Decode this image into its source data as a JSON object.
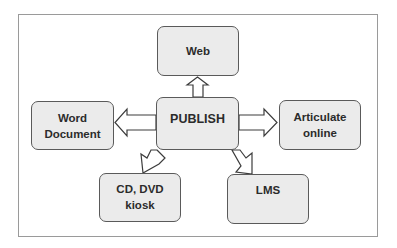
{
  "diagram": {
    "type": "hub-and-spoke",
    "center": {
      "id": "publish",
      "lines": [
        "PUBLISH"
      ]
    },
    "nodes": [
      {
        "id": "web",
        "lines": [
          "Web"
        ],
        "position": "top"
      },
      {
        "id": "word-document",
        "lines": [
          "Word",
          "Document"
        ],
        "position": "left"
      },
      {
        "id": "articulate-online",
        "lines": [
          "Articulate",
          "online"
        ],
        "position": "right"
      },
      {
        "id": "cd-dvd-kiosk",
        "lines": [
          "CD, DVD",
          "kiosk"
        ],
        "position": "bottom-left"
      },
      {
        "id": "lms",
        "lines": [
          "LMS"
        ],
        "position": "bottom-right"
      }
    ],
    "edges": [
      {
        "from": "publish",
        "to": "web",
        "style": "block-arrow"
      },
      {
        "from": "publish",
        "to": "word-document",
        "style": "block-arrow"
      },
      {
        "from": "publish",
        "to": "articulate-online",
        "style": "block-arrow"
      },
      {
        "from": "publish",
        "to": "cd-dvd-kiosk",
        "style": "block-arrow"
      },
      {
        "from": "publish",
        "to": "lms",
        "style": "block-arrow"
      }
    ]
  },
  "colors": {
    "node_fill": "#ebebeb",
    "node_border": "#5a5a5a",
    "text": "#2b2b2b",
    "arrow_fill": "#ffffff",
    "arrow_stroke": "#3c3c3c",
    "frame_border": "#9a9a9a"
  }
}
